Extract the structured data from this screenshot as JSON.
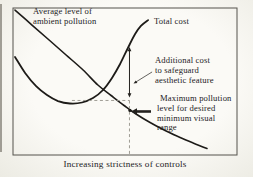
{
  "figure_title": "Pollution control cost diagram",
  "chart_data": {
    "type": "line",
    "title": "",
    "xlabel": "Increasing strictness of controls",
    "ylabel": "",
    "axes_numeric": false,
    "grid": false,
    "legend_position": "inline-labels",
    "colors": {
      "curve": "#1d1b18",
      "dashed": "#94928a",
      "border": "#55534d",
      "arrow": "#23211e",
      "text": "#23211e",
      "background": "#f5f3ee"
    },
    "series": [
      {
        "name": "Average level of ambient pollution",
        "label_lines": [
          "Average level of",
          "ambient pollution"
        ],
        "x_pct": [
          0.9,
          8.5,
          16.1,
          23.7,
          31.3,
          37.9,
          43.8,
          49.6,
          54.9,
          61.2,
          67.9,
          74.6,
          80.4,
          86.6
        ],
        "y_pct": [
          98.6,
          88.4,
          78.2,
          68.0,
          57.8,
          47.6,
          40.5,
          33.7,
          27.9,
          22.1,
          16.7,
          11.9,
          8.2,
          4.4
        ]
      },
      {
        "name": "Total cost",
        "label_lines": [
          "Total cost"
        ],
        "x_pct": [
          0.9,
          5.4,
          10.3,
          15.2,
          20.1,
          25.4,
          30.8,
          35.7,
          40.2,
          44.2,
          47.8,
          51.3,
          54.5,
          57.1,
          60.3
        ],
        "y_pct": [
          66.7,
          55.8,
          46.9,
          40.8,
          36.7,
          35.0,
          35.7,
          38.8,
          44.2,
          52.4,
          61.9,
          72.8,
          82.3,
          87.8,
          91.8
        ]
      }
    ],
    "guides": {
      "vline_x_pct": 52.0,
      "vline_y_bottom_pct": 0.7,
      "hline_y_pct": 37.1,
      "hline_x0_pct": 26.3
    },
    "annotations": [
      {
        "name": "additional-cost",
        "lines": [
          "Additional cost",
          "to safeguard",
          "aesthetic feature"
        ],
        "arrow": {
          "style": "double-vertical",
          "x_pct": 52.0,
          "y_top_pct": 73.5,
          "y_bottom_pct": 39.1
        },
        "leader": {
          "x1_pct": 62.1,
          "y1_pct": 56.5,
          "x2_pct": 53.8,
          "y2_pct": 48.6
        }
      },
      {
        "name": "max-pollution-level",
        "lines": [
          "Maximum pollution",
          "level for desired",
          "minimum visual",
          "range"
        ],
        "arrow": {
          "style": "thick-left",
          "y_pct": 29.6,
          "tip_x_pct": 52.7,
          "tail_x_pct": 61.6
        },
        "dot": {
          "x_pct": 52.2,
          "y_pct": 30.3
        }
      }
    ]
  }
}
